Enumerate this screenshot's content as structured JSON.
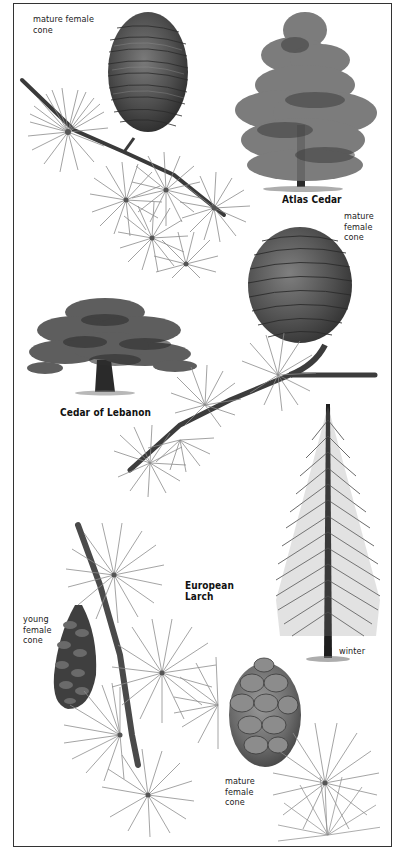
{
  "plate": {
    "species": [
      {
        "name": "Atlas Cedar",
        "parts": [
          "mature female cone",
          "foliage shoot",
          "tree habit"
        ]
      },
      {
        "name": "Cedar of Lebanon",
        "parts": [
          "mature female cone",
          "foliage shoot",
          "tree habit"
        ]
      },
      {
        "name": "European Larch",
        "parts": [
          "young female cone",
          "mature female cone",
          "foliage shoot",
          "winter tree habit"
        ]
      }
    ]
  },
  "labels": {
    "atlas_cone": "mature female\ncone",
    "atlas_cone_line1": "mature female",
    "atlas_cone_line2": "cone",
    "atlas_tree": "Atlas Cedar",
    "lebanon_cone_line1": "mature",
    "lebanon_cone_line2": "female",
    "lebanon_cone_line3": "cone",
    "lebanon_tree": "Cedar of Lebanon",
    "larch_title_line1": "European",
    "larch_title_line2": "Larch",
    "larch_young_line1": "young",
    "larch_young_line2": "female",
    "larch_young_line3": "cone",
    "larch_winter": "winter",
    "larch_mature_line1": "mature",
    "larch_mature_line2": "female",
    "larch_mature_line3": "cone"
  },
  "colors": {
    "frame": "#333333",
    "ink": "#222222",
    "needle": "#8a8a8a",
    "cone_dark": "#4a4a4a",
    "foliage": "#6e6e6e",
    "trunk": "#1e1e1e"
  }
}
